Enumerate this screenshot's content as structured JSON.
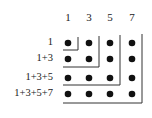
{
  "diagram": {
    "title": "",
    "column_labels": [
      "1",
      "3",
      "5",
      "7"
    ],
    "row_labels": [
      "1",
      "1+3",
      "1+3+5",
      "1+3+5+7"
    ],
    "grid": {
      "rows": 4,
      "cols": 4,
      "dot_color": "#111111",
      "line_color": "#333333"
    },
    "concept": "Sum of first n odd numbers forms an n×n square of dots"
  }
}
